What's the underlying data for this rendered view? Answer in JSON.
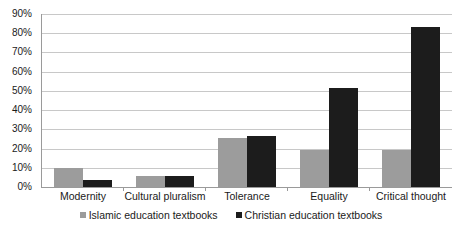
{
  "chart_data": {
    "type": "bar",
    "title": "",
    "subtitle": "",
    "xlabel": "",
    "ylabel": "",
    "ylim": [
      0,
      90
    ],
    "ytick_step": 10,
    "ytick_labels": [
      "90%",
      "80%",
      "70%",
      "60%",
      "50%",
      "40%",
      "30%",
      "20%",
      "10%",
      "0%"
    ],
    "grid": true,
    "legend_position": "bottom-center",
    "categories": [
      "Modernity",
      "Cultural pluralism",
      "Tolerance",
      "Equality",
      "Critical thought"
    ],
    "series": [
      {
        "name": "Islamic education textbooks",
        "color": "#9c9c9c",
        "values": [
          10,
          5.5,
          25.5,
          19.5,
          19.5
        ]
      },
      {
        "name": "Christian education textbooks",
        "color": "#1c1c1c",
        "values": [
          3.5,
          5.5,
          26.5,
          51.5,
          83
        ]
      }
    ]
  },
  "axis": {
    "axis_color": "#9a9a9a",
    "grid_color": "#c8c8c8"
  }
}
